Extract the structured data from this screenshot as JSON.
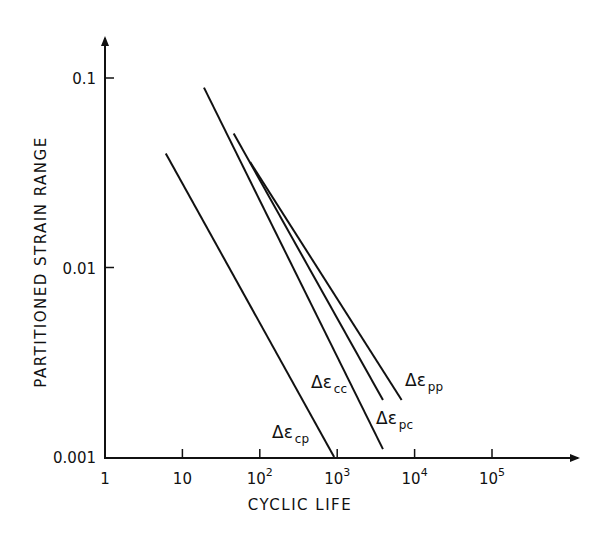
{
  "chart_data": {
    "type": "line",
    "title": "",
    "xlabel": "CYCLIC LIFE",
    "ylabel": "PARTITIONED STRAIN RANGE",
    "xscale": "log",
    "yscale": "log",
    "xlim": [
      1,
      1000000
    ],
    "ylim": [
      0.001,
      0.2
    ],
    "x_ticks": [
      {
        "value": 1,
        "label": "1",
        "base": "1",
        "exp": ""
      },
      {
        "value": 10,
        "label": "10",
        "base": "10",
        "exp": ""
      },
      {
        "value": 100,
        "label": "10^2",
        "base": "10",
        "exp": "2"
      },
      {
        "value": 1000,
        "label": "10^3",
        "base": "10",
        "exp": "3"
      },
      {
        "value": 10000,
        "label": "10^4",
        "base": "10",
        "exp": "4"
      },
      {
        "value": 100000,
        "label": "10^5",
        "base": "10",
        "exp": "5"
      }
    ],
    "y_ticks": [
      {
        "value": 0.001,
        "label": "0.001"
      },
      {
        "value": 0.01,
        "label": "0.01"
      },
      {
        "value": 0.1,
        "label": "0.1"
      }
    ],
    "grid": false,
    "legend": "inline labels at lower end of each line",
    "series": [
      {
        "name": "Δε_cp",
        "symbol": "Δε",
        "sub": "cp",
        "x": [
          6.1,
          913
        ],
        "y": [
          0.04,
          0.001
        ]
      },
      {
        "name": "Δε_cc",
        "symbol": "Δε",
        "sub": "cc",
        "x": [
          19,
          3900
        ],
        "y": [
          0.089,
          0.0011
        ]
      },
      {
        "name": "Δε_pc",
        "symbol": "Δε",
        "sub": "pc",
        "x": [
          46,
          3900
        ],
        "y": [
          0.051,
          0.002
        ]
      },
      {
        "name": "Δε_pp",
        "symbol": "Δε",
        "sub": "pp",
        "x": [
          75,
          6800
        ],
        "y": [
          0.036,
          0.002
        ]
      }
    ]
  },
  "colors": {
    "ink": "#111111",
    "background": "#ffffff"
  }
}
